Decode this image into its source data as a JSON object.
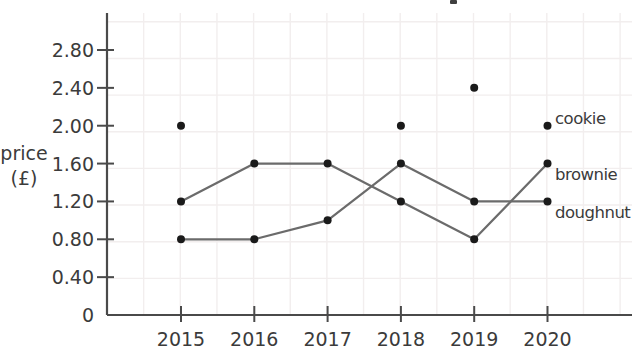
{
  "chart_data": {
    "type": "line",
    "title": "",
    "x_categories": [
      "2015",
      "2016",
      "2017",
      "2018",
      "2019",
      "2020"
    ],
    "series": [
      {
        "name": "cookie",
        "values": [
          2.0,
          null,
          null,
          2.0,
          2.4,
          2.0
        ],
        "draw": "points-only"
      },
      {
        "name": "brownie",
        "values": [
          1.2,
          1.6,
          1.6,
          1.2,
          0.8,
          1.6
        ],
        "draw": "line-with-points"
      },
      {
        "name": "doughnut",
        "values": [
          0.8,
          0.8,
          1.0,
          1.6,
          1.2,
          1.2
        ],
        "draw": "line-with-points"
      }
    ],
    "ylabel": "price (£)",
    "ylabel_lines": [
      "price",
      "(£)"
    ],
    "xlabel": "",
    "ytick_labels": [
      "2.80",
      "2.40",
      "2.00",
      "1.60",
      "1.20",
      "0.80",
      "0.40",
      "0"
    ],
    "ytick_values": [
      2.8,
      2.4,
      2.0,
      1.6,
      1.2,
      0.8,
      0.4,
      0
    ],
    "ylim": [
      0,
      3.2
    ],
    "grid": true,
    "legend_position": "inline-labels-right-of-last-point",
    "colors": {
      "line": "#6b6b6b",
      "point": "#1a1a1a",
      "axis": "#4a4a4a",
      "grid": "#f2eeee",
      "text": "#3b3b3b"
    }
  }
}
